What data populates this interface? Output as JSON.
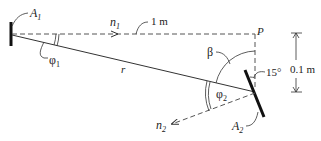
{
  "diagram": {
    "labels": {
      "A1": "A",
      "A1_sub": "1",
      "A2": "A",
      "A2_sub": "2",
      "n1": "n",
      "n1_sub": "1",
      "n2": "n",
      "n2_sub": "2",
      "phi1": "φ",
      "phi1_sub": "1",
      "phi2": "φ",
      "phi2_sub": "2",
      "r": "r",
      "P": "P",
      "beta": "β",
      "angle15": "15°",
      "distance_horizontal": "1 m",
      "distance_vertical": "0.1 m"
    },
    "colors": {
      "line": "#333333",
      "plate": "#111111"
    }
  }
}
